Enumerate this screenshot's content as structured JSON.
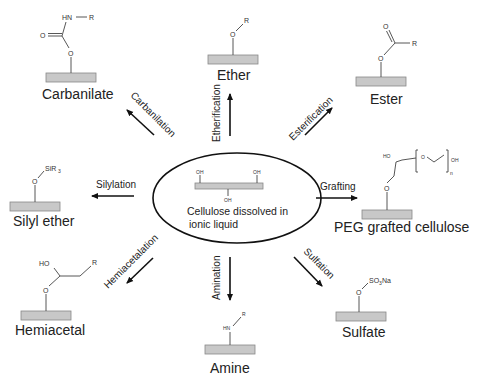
{
  "diagram": {
    "title": "",
    "center": {
      "line1": "Cellulose dissolved in",
      "line2": "ionic liquid",
      "oh_labels": [
        "OH",
        "OH",
        "OH"
      ]
    },
    "products": [
      {
        "id": "carbanilate",
        "label": "Carbanilate",
        "reaction": "Carbanilation",
        "atoms": [
          "HN",
          "R",
          "O",
          "O"
        ]
      },
      {
        "id": "ether",
        "label": "Ether",
        "reaction": "Etherification",
        "atoms": [
          "O",
          "R"
        ]
      },
      {
        "id": "ester",
        "label": "Ester",
        "reaction": "Esterification",
        "atoms": [
          "O",
          "R",
          "O"
        ]
      },
      {
        "id": "silyl-ether",
        "label": "Silyl ether",
        "reaction": "Silylation",
        "atoms": [
          "O",
          "SiR",
          "3"
        ]
      },
      {
        "id": "peg-grafted",
        "label": "PEG grafted cellulose",
        "reaction": "Grafting",
        "atoms": [
          "HO",
          "O",
          "O",
          "OH",
          "n"
        ]
      },
      {
        "id": "hemiacetal",
        "label": "Hemiacetal",
        "reaction": "Hemiacetalation",
        "atoms": [
          "HO",
          "O",
          "R"
        ]
      },
      {
        "id": "amine",
        "label": "Amine",
        "reaction": "Amination",
        "atoms": [
          "HN",
          "R"
        ]
      },
      {
        "id": "sulfate",
        "label": "Sulfate",
        "reaction": "Sulfation",
        "atoms": [
          "O",
          "SO",
          "3",
          "Na"
        ]
      }
    ],
    "colors": {
      "substrate_bar": "#c8c8c8",
      "ink": "#222222"
    }
  }
}
